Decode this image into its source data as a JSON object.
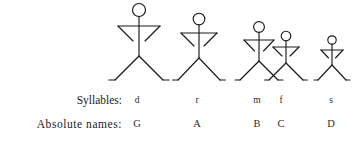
{
  "diagram": {
    "title_alt": "Stick figures of decreasing height representing descending musical pitches",
    "background_color": "#ffffff",
    "stroke_color": "#1a1a1a",
    "ground_baseline_y": 80,
    "figures": [
      {
        "id": "figure-1",
        "name": "figure-do",
        "center_x": 139,
        "head_center_y": 10,
        "head_radius": 6.5,
        "shoulder_y": 26,
        "shoulder_half_width": 21,
        "hip_y": 56,
        "foot_half_width": 24,
        "arm_inner_dx": 6,
        "arm_elbow_y": 41,
        "scale_label": "tallest"
      },
      {
        "id": "figure-2",
        "name": "figure-re",
        "center_x": 199,
        "head_center_y": 19,
        "head_radius": 5.8,
        "shoulder_y": 33,
        "shoulder_half_width": 18,
        "hip_y": 58,
        "foot_half_width": 21,
        "arm_inner_dx": 5,
        "arm_elbow_y": 46,
        "scale_label": "tall"
      },
      {
        "id": "figure-3",
        "name": "figure-mi",
        "center_x": 259,
        "head_center_y": 27,
        "head_radius": 5.4,
        "shoulder_y": 40,
        "shoulder_half_width": 15,
        "hip_y": 61,
        "foot_half_width": 19,
        "arm_inner_dx": 4.5,
        "arm_elbow_y": 51,
        "scale_label": "medium"
      },
      {
        "id": "figure-4",
        "name": "figure-fa",
        "center_x": 286,
        "head_center_y": 36,
        "head_radius": 4.8,
        "shoulder_y": 47,
        "shoulder_half_width": 13,
        "hip_y": 63,
        "foot_half_width": 17,
        "arm_inner_dx": 4,
        "arm_elbow_y": 56,
        "scale_label": "short"
      },
      {
        "id": "figure-5",
        "name": "figure-so",
        "center_x": 332,
        "head_center_y": 40,
        "head_radius": 4.2,
        "shoulder_y": 50,
        "shoulder_half_width": 11,
        "hip_y": 65,
        "foot_half_width": 14,
        "arm_inner_dx": 3.5,
        "arm_elbow_y": 58,
        "scale_label": "shortest"
      }
    ],
    "columns": [
      {
        "x": 137,
        "syllable": "d",
        "absolute_name": "G"
      },
      {
        "x": 197,
        "syllable": "r",
        "absolute_name": "A"
      },
      {
        "x": 257,
        "syllable": "m",
        "absolute_name": "B"
      },
      {
        "x": 281,
        "syllable": "f",
        "absolute_name": "C"
      },
      {
        "x": 331,
        "syllable": "s",
        "absolute_name": "D"
      }
    ],
    "rows": {
      "syllables_label": "Syllables:",
      "absolute_names_label": "Absolute names:"
    }
  }
}
